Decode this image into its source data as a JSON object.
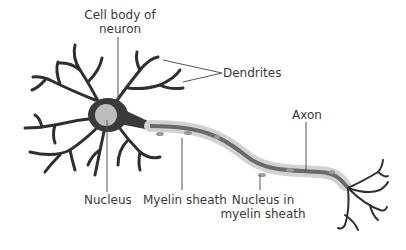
{
  "diagram": {
    "labels": {
      "cell_body_line1": "Cell body of",
      "cell_body_line2": "neuron",
      "dendrites": "Dendrites",
      "axon": "Axon",
      "nucleus": "Nucleus",
      "myelin_sheath": "Myelin sheath",
      "nucleus_myelin_line1": "Nucleus in",
      "nucleus_myelin_line2": "myelin sheath"
    },
    "colors": {
      "neuron": "#2f2f2f",
      "cell_body": "#555555",
      "nucleus": "#bdbdbd",
      "myelin": "#cfcfcf",
      "axon": "#6a6a6a",
      "leader_line": "#555555",
      "text": "#3a3a3a"
    }
  }
}
